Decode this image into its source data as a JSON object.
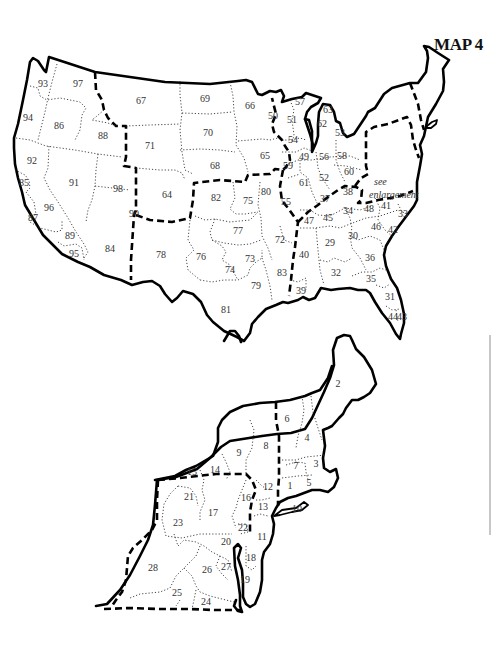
{
  "title": "MAP 4",
  "enlargement_note": [
    "see",
    "enlargement"
  ],
  "colors": {
    "line": "#000000",
    "label": "#333333",
    "background": "#ffffff"
  },
  "us_map": {
    "regions": [
      {
        "id": "93",
        "x": 43,
        "y": 85
      },
      {
        "id": "97",
        "x": 78,
        "y": 85
      },
      {
        "id": "67",
        "x": 141,
        "y": 102
      },
      {
        "id": "69",
        "x": 205,
        "y": 100
      },
      {
        "id": "66",
        "x": 250,
        "y": 107
      },
      {
        "id": "94",
        "x": 28,
        "y": 119
      },
      {
        "id": "86",
        "x": 59,
        "y": 127
      },
      {
        "id": "88",
        "x": 103,
        "y": 137
      },
      {
        "id": "71",
        "x": 150,
        "y": 147
      },
      {
        "id": "70",
        "x": 208,
        "y": 134
      },
      {
        "id": "92",
        "x": 32,
        "y": 162
      },
      {
        "id": "68",
        "x": 215,
        "y": 167
      },
      {
        "id": "65",
        "x": 265,
        "y": 157
      },
      {
        "id": "91",
        "x": 74,
        "y": 184
      },
      {
        "id": "98",
        "x": 118,
        "y": 190
      },
      {
        "id": "64",
        "x": 167,
        "y": 196
      },
      {
        "id": "82",
        "x": 216,
        "y": 199
      },
      {
        "id": "75",
        "x": 248,
        "y": 202
      },
      {
        "id": "80",
        "x": 266,
        "y": 193
      },
      {
        "id": "85",
        "x": 24,
        "y": 184
      },
      {
        "id": "96",
        "x": 49,
        "y": 209
      },
      {
        "id": "87",
        "x": 33,
        "y": 219
      },
      {
        "id": "90",
        "x": 134,
        "y": 215
      },
      {
        "id": "77",
        "x": 238,
        "y": 232
      },
      {
        "id": "89",
        "x": 70,
        "y": 237
      },
      {
        "id": "84",
        "x": 110,
        "y": 250
      },
      {
        "id": "95",
        "x": 74,
        "y": 255
      },
      {
        "id": "78",
        "x": 161,
        "y": 256
      },
      {
        "id": "76",
        "x": 201,
        "y": 258
      },
      {
        "id": "74",
        "x": 230,
        "y": 271
      },
      {
        "id": "73",
        "x": 250,
        "y": 260
      },
      {
        "id": "79",
        "x": 256,
        "y": 287
      },
      {
        "id": "81",
        "x": 226,
        "y": 311
      },
      {
        "id": "72",
        "x": 280,
        "y": 241
      },
      {
        "id": "83",
        "x": 282,
        "y": 274
      },
      {
        "id": "39",
        "x": 301,
        "y": 292
      },
      {
        "id": "40",
        "x": 304,
        "y": 256
      },
      {
        "id": "50",
        "x": 273,
        "y": 117
      },
      {
        "id": "51",
        "x": 292,
        "y": 121
      },
      {
        "id": "57",
        "x": 300,
        "y": 103
      },
      {
        "id": "54",
        "x": 293,
        "y": 141
      },
      {
        "id": "63",
        "x": 328,
        "y": 111
      },
      {
        "id": "62",
        "x": 322,
        "y": 125
      },
      {
        "id": "53",
        "x": 340,
        "y": 134
      },
      {
        "id": "49",
        "x": 304,
        "y": 158
      },
      {
        "id": "56",
        "x": 324,
        "y": 158
      },
      {
        "id": "58",
        "x": 342,
        "y": 157
      },
      {
        "id": "59",
        "x": 288,
        "y": 167
      },
      {
        "id": "61",
        "x": 304,
        "y": 184
      },
      {
        "id": "52",
        "x": 324,
        "y": 179
      },
      {
        "id": "60",
        "x": 349,
        "y": 173
      },
      {
        "id": "55",
        "x": 286,
        "y": 203
      },
      {
        "id": "37",
        "x": 325,
        "y": 200
      },
      {
        "id": "38",
        "x": 348,
        "y": 193
      },
      {
        "id": "47",
        "x": 309,
        "y": 222
      },
      {
        "id": "45",
        "x": 328,
        "y": 219
      },
      {
        "id": "34",
        "x": 348,
        "y": 212
      },
      {
        "id": "48",
        "x": 369,
        "y": 210
      },
      {
        "id": "41",
        "x": 386,
        "y": 207
      },
      {
        "id": "33",
        "x": 403,
        "y": 215
      },
      {
        "id": "46",
        "x": 376,
        "y": 228
      },
      {
        "id": "42",
        "x": 393,
        "y": 231
      },
      {
        "id": "29",
        "x": 330,
        "y": 244
      },
      {
        "id": "30",
        "x": 353,
        "y": 237
      },
      {
        "id": "36",
        "x": 370,
        "y": 259
      },
      {
        "id": "32",
        "x": 336,
        "y": 274
      },
      {
        "id": "35",
        "x": 371,
        "y": 280
      },
      {
        "id": "31",
        "x": 390,
        "y": 298
      },
      {
        "id": "44",
        "x": 393,
        "y": 318
      },
      {
        "id": "43",
        "x": 402,
        "y": 318
      }
    ]
  },
  "ne_map": {
    "regions": [
      {
        "id": "2",
        "x": 338,
        "y": 385
      },
      {
        "id": "6",
        "x": 287,
        "y": 420
      },
      {
        "id": "4",
        "x": 307,
        "y": 439
      },
      {
        "id": "9",
        "x": 239,
        "y": 454
      },
      {
        "id": "8",
        "x": 266,
        "y": 447
      },
      {
        "id": "7",
        "x": 296,
        "y": 467
      },
      {
        "id": "3",
        "x": 316,
        "y": 465
      },
      {
        "id": "15",
        "x": 192,
        "y": 473
      },
      {
        "id": "14",
        "x": 215,
        "y": 471
      },
      {
        "id": "1",
        "x": 290,
        "y": 487
      },
      {
        "id": "5",
        "x": 309,
        "y": 484
      },
      {
        "id": "12",
        "x": 268,
        "y": 488
      },
      {
        "id": "16",
        "x": 246,
        "y": 499
      },
      {
        "id": "21",
        "x": 189,
        "y": 498
      },
      {
        "id": "13",
        "x": 263,
        "y": 508
      },
      {
        "id": "10",
        "x": 297,
        "y": 510
      },
      {
        "id": "17",
        "x": 213,
        "y": 514
      },
      {
        "id": "23",
        "x": 178,
        "y": 524
      },
      {
        "id": "22",
        "x": 243,
        "y": 529
      },
      {
        "id": "11",
        "x": 262,
        "y": 538
      },
      {
        "id": "20",
        "x": 226,
        "y": 543
      },
      {
        "id": "18",
        "x": 251,
        "y": 559
      },
      {
        "id": "28",
        "x": 153,
        "y": 569
      },
      {
        "id": "27",
        "x": 226,
        "y": 568
      },
      {
        "id": "26",
        "x": 207,
        "y": 571
      },
      {
        "id": "19",
        "x": 245,
        "y": 581
      },
      {
        "id": "25",
        "x": 177,
        "y": 594
      },
      {
        "id": "24",
        "x": 206,
        "y": 603
      }
    ]
  }
}
